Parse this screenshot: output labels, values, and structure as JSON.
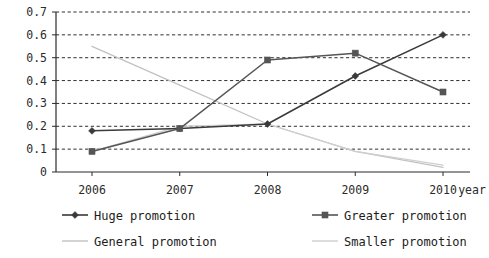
{
  "chart_data": {
    "type": "line",
    "title": "",
    "xlabel": "year",
    "ylabel": "",
    "categories": [
      "2006",
      "2007",
      "2008",
      "2009",
      "2010"
    ],
    "ylim": [
      0,
      0.7
    ],
    "yticks": [
      "0",
      "0.1",
      "0.2",
      "0.3",
      "0.4",
      "0.5",
      "0.6",
      "0.7"
    ],
    "ytick_values": [
      0,
      0.1,
      0.2,
      0.3,
      0.4,
      0.5,
      0.6,
      0.7
    ],
    "grid": true,
    "grid_style": "dashed-horizontal",
    "legend_position": "bottom",
    "series": [
      {
        "name": "Huge promotion",
        "marker": "diamond",
        "color": "#3a3a3a",
        "values": [
          0.18,
          0.19,
          0.21,
          0.42,
          0.6
        ]
      },
      {
        "name": "Greater promotion",
        "marker": "square",
        "color": "#555555",
        "values": [
          0.09,
          0.19,
          0.49,
          0.52,
          0.35
        ]
      },
      {
        "name": "General promotion",
        "marker": "none",
        "color": "#c2c2c2",
        "values": [
          0.55,
          0.38,
          0.21,
          0.09,
          0.02
        ]
      },
      {
        "name": "Smaller promotion",
        "marker": "none",
        "color": "#cfcfcf",
        "values": [
          0.09,
          0.2,
          0.21,
          0.09,
          0.03
        ]
      }
    ]
  },
  "axis": {
    "x_axis_name": "year"
  },
  "legend": {
    "items": [
      {
        "label": "Huge promotion"
      },
      {
        "label": "Greater promotion"
      },
      {
        "label": "General promotion"
      },
      {
        "label": "Smaller promotion"
      }
    ]
  }
}
